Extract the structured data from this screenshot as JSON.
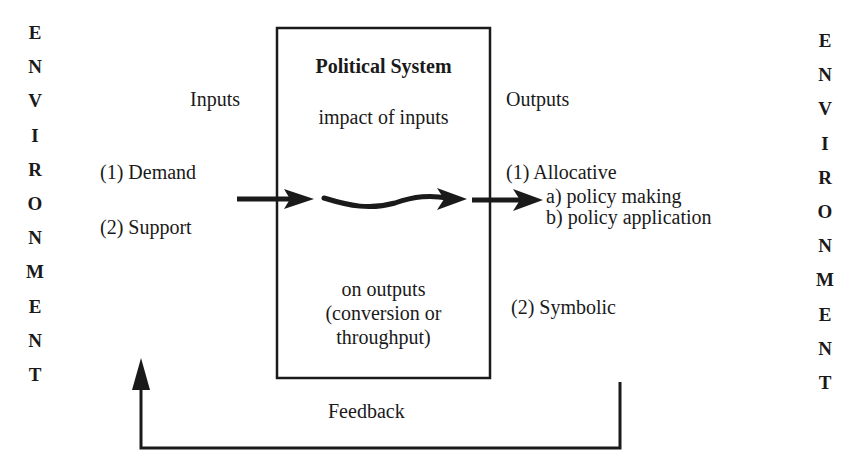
{
  "diagram": {
    "environment_left": [
      "E",
      "N",
      "V",
      "I",
      "R",
      "O",
      "N",
      "M",
      "E",
      "N",
      "T"
    ],
    "environment_right": [
      "E",
      "N",
      "V",
      "I",
      "R",
      "O",
      "N",
      "M",
      "E",
      "N",
      "T"
    ],
    "inputs": {
      "heading": "Inputs",
      "items": [
        "(1)  Demand",
        "(2)  Support"
      ]
    },
    "system": {
      "title": "Political System",
      "line1": "impact of inputs",
      "line2": "on outputs",
      "line3": "(conversion or",
      "line4": "throughput)"
    },
    "outputs": {
      "heading": "Outputs",
      "allocative": "(1)  Allocative",
      "sub_a": "a)  policy making",
      "sub_b": "b)  policy application",
      "symbolic": "(2)  Symbolic"
    },
    "feedback": "Feedback",
    "colors": {
      "ink": "#1a1a1a",
      "background": "#ffffff"
    }
  }
}
